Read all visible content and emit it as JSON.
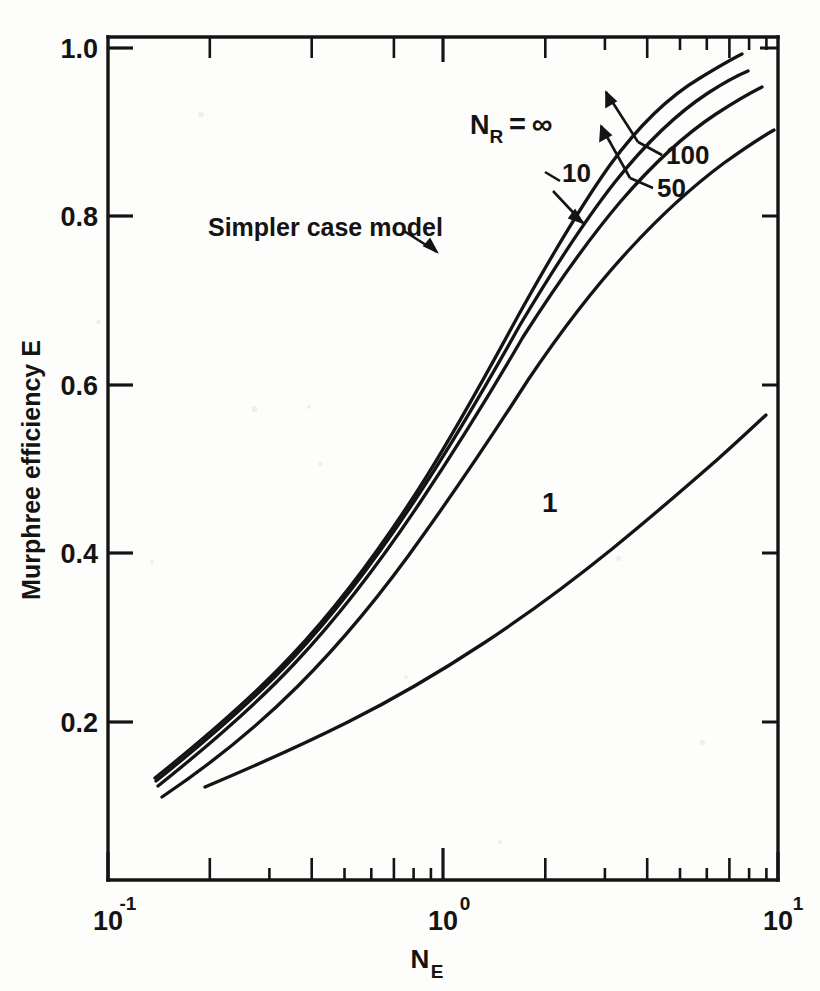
{
  "figure": {
    "background_color": "#fdfdfc",
    "ink_color": "#141414"
  },
  "chart_data": {
    "type": "line",
    "title": "",
    "xlabel": "N_E",
    "ylabel": "Murphree efficiency E",
    "xscale": "log",
    "yscale": "linear",
    "xlim": [
      0.1,
      10
    ],
    "ylim": [
      0.1,
      1.04
    ],
    "grid": false,
    "legend_position": "inline-annotations",
    "x_tick_labels": [
      "10⁻¹",
      "10⁰",
      "10¹"
    ],
    "x_tick_values": [
      0.1,
      1,
      10
    ],
    "x_minor_ticks": [
      0.2,
      0.3,
      0.4,
      0.5,
      0.6,
      0.7,
      0.8,
      0.9,
      2,
      3,
      4,
      5,
      6,
      7,
      8,
      9
    ],
    "y_tick_labels": [
      "0.2",
      "0.4",
      "0.6",
      "0.8",
      "1.0"
    ],
    "y_tick_values": [
      0.2,
      0.4,
      0.6,
      0.8,
      1.0
    ],
    "series": [
      {
        "name": "N_R = ∞",
        "label": "Nᴿ = ∞",
        "x": [
          0.129,
          0.16,
          0.2,
          0.26,
          0.34,
          0.45,
          0.6,
          0.8,
          1.05,
          1.4,
          1.8,
          2.3,
          3.0,
          3.9,
          5.0,
          6.2,
          7.2
        ],
        "y": [
          0.137,
          0.168,
          0.205,
          0.255,
          0.315,
          0.383,
          0.463,
          0.549,
          0.637,
          0.727,
          0.801,
          0.866,
          0.918,
          0.955,
          0.977,
          0.99,
          0.997
        ]
      },
      {
        "name": "N_R = 100",
        "label": "100",
        "x": [
          0.129,
          0.16,
          0.2,
          0.26,
          0.34,
          0.45,
          0.6,
          0.8,
          1.05,
          1.4,
          1.8,
          2.3,
          3.0,
          3.9,
          5.0,
          6.2,
          7.4
        ],
        "y": [
          0.136,
          0.167,
          0.204,
          0.253,
          0.312,
          0.379,
          0.458,
          0.543,
          0.629,
          0.716,
          0.788,
          0.851,
          0.902,
          0.938,
          0.96,
          0.974,
          0.983
        ]
      },
      {
        "name": "N_R = 50",
        "label": "50",
        "x": [
          0.129,
          0.16,
          0.2,
          0.26,
          0.34,
          0.45,
          0.6,
          0.8,
          1.05,
          1.4,
          1.8,
          2.3,
          3.0,
          3.9,
          5.0,
          6.4,
          8.2
        ],
        "y": [
          0.135,
          0.166,
          0.202,
          0.251,
          0.309,
          0.375,
          0.452,
          0.535,
          0.619,
          0.704,
          0.774,
          0.834,
          0.884,
          0.92,
          0.943,
          0.96,
          0.972
        ]
      },
      {
        "name": "N_R = 10",
        "label": "10",
        "x": [
          0.138,
          0.17,
          0.21,
          0.27,
          0.35,
          0.46,
          0.61,
          0.81,
          1.06,
          1.4,
          1.8,
          2.3,
          3.0,
          3.9,
          5.0,
          6.4,
          8.0,
          9.4
        ],
        "y": [
          0.122,
          0.15,
          0.183,
          0.228,
          0.283,
          0.346,
          0.42,
          0.5,
          0.58,
          0.661,
          0.729,
          0.79,
          0.843,
          0.884,
          0.913,
          0.935,
          0.951,
          0.962
        ]
      },
      {
        "name": "N_R = 1",
        "label": "1",
        "x": [
          0.19,
          0.24,
          0.3,
          0.39,
          0.5,
          0.65,
          0.85,
          1.1,
          1.45,
          1.9,
          2.5,
          3.2,
          4.2,
          5.4,
          7.0,
          8.7
        ],
        "y": [
          0.122,
          0.144,
          0.166,
          0.195,
          0.225,
          0.26,
          0.296,
          0.333,
          0.373,
          0.414,
          0.456,
          0.491,
          0.527,
          0.553,
          0.569,
          0.576
        ]
      }
    ],
    "annotations": [
      {
        "text": "Nᴿ = ∞",
        "x_px": 545,
        "y_px": 125,
        "kind": "series-label"
      },
      {
        "text": "10",
        "x_px": 574,
        "y_px": 173,
        "kind": "series-label-leader"
      },
      {
        "text": "100",
        "x_px": 669,
        "y_px": 155,
        "kind": "series-label-leader"
      },
      {
        "text": "50",
        "x_px": 663,
        "y_px": 188,
        "kind": "series-label-leader"
      },
      {
        "text": "1",
        "x_px": 548,
        "y_px": 502,
        "kind": "series-label"
      },
      {
        "text": "Simpler case model",
        "x_px": 230,
        "y_px": 226,
        "kind": "callout"
      }
    ]
  },
  "axis_labels": {
    "y_axis_title": "Murphree efficiency E",
    "x_axis_title_base": "N",
    "x_axis_title_sub": "E"
  },
  "tick_text": {
    "y": [
      "1.0",
      "0.8",
      "0.6",
      "0.4",
      "0.2"
    ],
    "x_mantissa": "10",
    "x_exponents": [
      "-1",
      "0",
      "1"
    ]
  }
}
